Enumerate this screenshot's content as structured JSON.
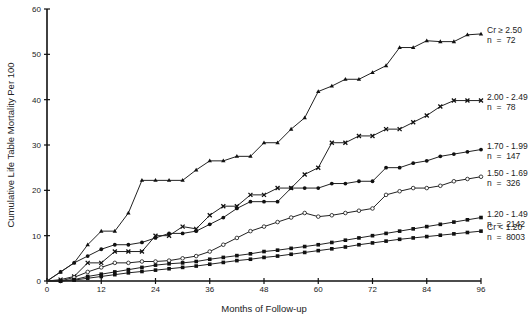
{
  "chart_data": {
    "type": "line",
    "title": "",
    "xlabel": "Months of Follow-up",
    "ylabel": "Cumulative Life Table Mortality Per 100",
    "xlim": [
      0,
      96
    ],
    "ylim": [
      0,
      60
    ],
    "xticks": [
      0,
      12,
      24,
      36,
      48,
      60,
      72,
      84,
      96
    ],
    "yticks": [
      0,
      10,
      20,
      30,
      40,
      50,
      60
    ],
    "grid": false,
    "legend_position": "right, inline at line ends",
    "x": [
      0,
      3,
      6,
      9,
      12,
      15,
      18,
      21,
      24,
      27,
      30,
      33,
      36,
      39,
      42,
      45,
      48,
      51,
      54,
      57,
      60,
      63,
      66,
      69,
      72,
      75,
      78,
      81,
      84,
      87,
      90,
      93,
      96
    ],
    "series": [
      {
        "name": "Cr ≥ 2.50",
        "label_line1": "Cr ≥ 2.50",
        "label_line2": "n  =  72",
        "marker": "triangle",
        "values": [
          0,
          2,
          4,
          8,
          11,
          11,
          15,
          22.2,
          22.2,
          22.2,
          22.2,
          24.5,
          26.5,
          26.5,
          27.5,
          27.5,
          30.5,
          30.5,
          33.5,
          36,
          41.8,
          43,
          44.5,
          44.5,
          46,
          47.5,
          51.5,
          51.5,
          53,
          52.8,
          52.8,
          54.3,
          54.5
        ]
      },
      {
        "name": "2.00 - 2.49",
        "label_line1": "2.00 - 2.49",
        "label_line2": "n  =  78",
        "marker": "x",
        "values": [
          0,
          0.3,
          1,
          4,
          4,
          6.5,
          6.5,
          6.5,
          10,
          10,
          12,
          11.5,
          14.5,
          16.5,
          16.5,
          19,
          19,
          20.5,
          20.5,
          23.5,
          25,
          30.5,
          30.5,
          32,
          32,
          33.5,
          33.5,
          35,
          36.5,
          38.5,
          39.8,
          39.8,
          39.8
        ]
      },
      {
        "name": "1.70 - 1.99",
        "label_line1": "1.70 - 1.99",
        "label_line2": "n  =  147",
        "marker": "filled-circle",
        "values": [
          0,
          2,
          4,
          5.5,
          7,
          8,
          8,
          8.5,
          9.5,
          10.5,
          10.5,
          11,
          12.5,
          14,
          16,
          17.5,
          17.5,
          17.5,
          20.5,
          20.5,
          20.5,
          21.5,
          21.5,
          22,
          22,
          25,
          25,
          26,
          26.5,
          27.5,
          28,
          28.5,
          29
        ]
      },
      {
        "name": "1.50 - 1.69",
        "label_line1": "1.50 - 1.69",
        "label_line2": "n  =  326",
        "marker": "open-circle",
        "values": [
          0,
          0,
          0.8,
          2,
          3,
          4,
          4,
          4.3,
          4.3,
          4.5,
          5,
          5.5,
          6.5,
          8,
          9.5,
          11,
          12,
          13,
          14,
          15,
          14.2,
          14.5,
          15,
          15.5,
          16,
          19,
          19.8,
          20.5,
          20.5,
          21,
          22,
          22.5,
          23
        ]
      },
      {
        "name": "1.20 - 1.49",
        "label_line1": "1.20 - 1.49",
        "label_line2": "n  =  2142",
        "marker": "filled-square",
        "values": [
          0,
          0,
          0.3,
          1,
          1.5,
          2,
          2.5,
          3,
          3.5,
          3.8,
          4,
          4.3,
          4.8,
          5.2,
          5.6,
          6,
          6.5,
          6.8,
          7.2,
          7.6,
          8,
          8.5,
          9,
          9.5,
          10,
          10.5,
          11,
          11.5,
          12,
          12.5,
          13,
          13.5,
          14
        ]
      },
      {
        "name": "Cr < 1.20",
        "label_line1": "Cr < 1.20",
        "label_line2": "n  =  8003",
        "marker": "filled-square",
        "values": [
          0,
          0,
          0.2,
          0.6,
          1,
          1.4,
          1.8,
          2.1,
          2.4,
          2.7,
          3,
          3.3,
          3.7,
          4.1,
          4.5,
          4.8,
          5.2,
          5.5,
          5.9,
          6.3,
          6.7,
          7.1,
          7.5,
          8,
          8.4,
          8.8,
          9.2,
          9.5,
          9.8,
          10.1,
          10.4,
          10.7,
          11
        ]
      }
    ]
  }
}
